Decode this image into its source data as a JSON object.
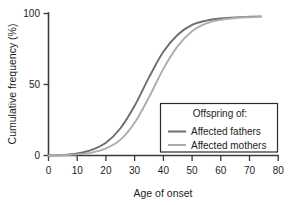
{
  "chart_data": {
    "type": "line",
    "title": "",
    "xlabel": "Age of onset",
    "ylabel": "Cumulative frequency (%)",
    "xlim": [
      0,
      80
    ],
    "ylim": [
      0,
      100
    ],
    "xticks": [
      0,
      10,
      20,
      30,
      40,
      50,
      60,
      70,
      80
    ],
    "yticks": [
      0,
      50,
      100
    ],
    "grid": false,
    "legend_position": "lower-right",
    "legend_title": "Offspring of:",
    "x": [
      0,
      5,
      10,
      15,
      20,
      25,
      30,
      35,
      40,
      45,
      50,
      55,
      60,
      65,
      70,
      74
    ],
    "series": [
      {
        "name": "Affected fathers",
        "color": "#6d6d6d",
        "values": [
          0,
          0.4,
          1.5,
          4,
          9,
          19,
          35,
          55,
          73,
          85,
          92,
          95,
          96.5,
          97.3,
          97.7,
          98
        ]
      },
      {
        "name": "Affected mothers",
        "color": "#adadad",
        "values": [
          0,
          0.2,
          0.8,
          2,
          5,
          11,
          23,
          41,
          61,
          77,
          87.5,
          93,
          95.5,
          96.8,
          97.4,
          97.7
        ]
      }
    ]
  },
  "axes": {
    "x_tick_labels": [
      "0",
      "10",
      "20",
      "30",
      "40",
      "50",
      "60",
      "70",
      "80"
    ],
    "y_tick_labels": [
      "0",
      "50",
      "100"
    ],
    "x_title": "Age of onset",
    "y_title": "Cumulative frequency (%)"
  },
  "legend": {
    "title": "Offspring of:",
    "entries": [
      {
        "label": "Affected fathers",
        "color": "#6d6d6d"
      },
      {
        "label": "Affected mothers",
        "color": "#adadad"
      }
    ]
  },
  "colors": {
    "axis": "#3a3a3a",
    "text": "#1d1d1d",
    "background": "#ffffff",
    "fathers": "#6d6d6d",
    "mothers": "#adadad"
  }
}
